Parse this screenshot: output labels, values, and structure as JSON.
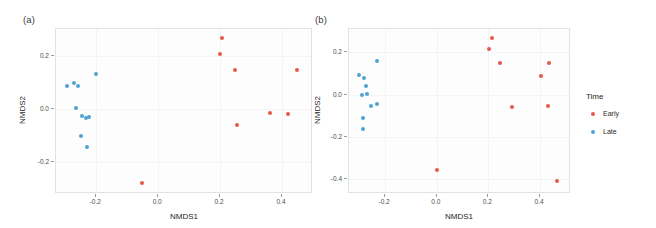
{
  "figure": {
    "background": "#ffffff",
    "panel_background": "#fdfdfd",
    "grid_color": "#f4f4f4"
  },
  "legend": {
    "title": "Time",
    "items": [
      {
        "label": "Early",
        "color": "#E8584A"
      },
      {
        "label": "Late",
        "color": "#4FA3D1"
      }
    ]
  },
  "colors": {
    "early": "#E8584A",
    "late": "#4FA3D1"
  },
  "chart_data": [
    {
      "type": "scatter",
      "panel_label": "(a)",
      "title": "",
      "xlabel": "NMDS1",
      "ylabel": "NMDS2",
      "xlim": [
        -0.33,
        0.5
      ],
      "ylim": [
        -0.32,
        0.3
      ],
      "xticks": [
        -0.2,
        0.0,
        0.2,
        0.4
      ],
      "xticklabels": [
        "-0.2",
        "0.0",
        "0.2",
        "0.4"
      ],
      "yticks": [
        0.2,
        0.0,
        -0.2
      ],
      "yticklabels": [
        "0.2",
        "0.0",
        "-0.2"
      ],
      "grid": true,
      "legend_position": "right",
      "series": [
        {
          "name": "Early",
          "color": "#E8584A",
          "points": [
            {
              "x": 0.207,
              "y": 0.266
            },
            {
              "x": 0.198,
              "y": 0.205
            },
            {
              "x": 0.247,
              "y": 0.145
            },
            {
              "x": 0.447,
              "y": 0.146
            },
            {
              "x": 0.36,
              "y": -0.015
            },
            {
              "x": 0.419,
              "y": -0.02
            },
            {
              "x": 0.255,
              "y": -0.059
            },
            {
              "x": -0.052,
              "y": -0.277
            }
          ]
        },
        {
          "name": "Late",
          "color": "#4FA3D1",
          "points": [
            {
              "x": -0.201,
              "y": 0.13
            },
            {
              "x": -0.272,
              "y": 0.097
            },
            {
              "x": -0.295,
              "y": 0.087
            },
            {
              "x": -0.258,
              "y": 0.085
            },
            {
              "x": -0.266,
              "y": 0.004
            },
            {
              "x": -0.246,
              "y": -0.025
            },
            {
              "x": -0.222,
              "y": -0.03
            },
            {
              "x": -0.232,
              "y": -0.034
            },
            {
              "x": -0.248,
              "y": -0.101
            },
            {
              "x": -0.229,
              "y": -0.142
            }
          ]
        }
      ]
    },
    {
      "type": "scatter",
      "panel_label": "(b)",
      "title": "",
      "xlabel": "NMDS1",
      "ylabel": "NMDS2",
      "xlim": [
        -0.34,
        0.52
      ],
      "ylim": [
        -0.47,
        0.31
      ],
      "xticks": [
        -0.2,
        0.0,
        0.2,
        0.4
      ],
      "xticklabels": [
        "-0.2",
        "0.0",
        "0.2",
        "0.4"
      ],
      "yticks": [
        0.2,
        0.0,
        -0.2,
        -0.4
      ],
      "yticklabels": [
        "0.2",
        "0.0",
        "-0.2",
        "-0.4"
      ],
      "grid": true,
      "legend_position": "right",
      "series": [
        {
          "name": "Early",
          "color": "#E8584A",
          "points": [
            {
              "x": 0.213,
              "y": 0.268
            },
            {
              "x": 0.203,
              "y": 0.217
            },
            {
              "x": 0.243,
              "y": 0.148
            },
            {
              "x": 0.436,
              "y": 0.149
            },
            {
              "x": 0.402,
              "y": 0.088
            },
            {
              "x": 0.291,
              "y": -0.057
            },
            {
              "x": 0.43,
              "y": -0.053
            },
            {
              "x": 0.0,
              "y": -0.358
            },
            {
              "x": 0.466,
              "y": -0.408
            }
          ]
        },
        {
          "name": "Late",
          "color": "#4FA3D1",
          "points": [
            {
              "x": -0.231,
              "y": 0.158
            },
            {
              "x": -0.301,
              "y": 0.094
            },
            {
              "x": -0.283,
              "y": 0.077
            },
            {
              "x": -0.273,
              "y": 0.043
            },
            {
              "x": -0.288,
              "y": 0.0
            },
            {
              "x": -0.271,
              "y": 0.003
            },
            {
              "x": -0.23,
              "y": -0.042
            },
            {
              "x": -0.256,
              "y": -0.055
            },
            {
              "x": -0.285,
              "y": -0.11
            },
            {
              "x": -0.287,
              "y": -0.161
            }
          ]
        }
      ]
    }
  ]
}
